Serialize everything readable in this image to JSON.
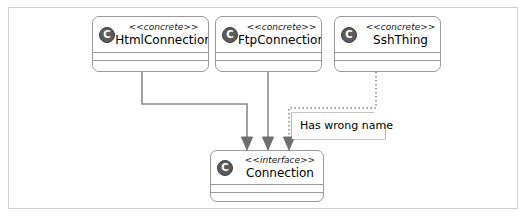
{
  "diagram": {
    "frame_border_color": "#d0d0d0",
    "box_border_color": "#9a9a9a",
    "edge_color": "#8a8a8a",
    "icon_color": "#5b5b5b",
    "classes": [
      {
        "id": "html-connection",
        "stereotype": "<<concrete>>",
        "name": "HtmlConnection",
        "icon": "C"
      },
      {
        "id": "ftp-connection",
        "stereotype": "<<concrete>>",
        "name": "FtpConnection",
        "icon": "C"
      },
      {
        "id": "ssh-thing",
        "stereotype": "<<concrete>>",
        "name": "SshThing",
        "icon": "C"
      },
      {
        "id": "connection",
        "stereotype": "<<interface>>",
        "name": "Connection",
        "icon": "C"
      }
    ],
    "note": {
      "id": "wrong-name-note",
      "text": "Has wrong name"
    },
    "edges": [
      {
        "id": "html-to-connection",
        "from": "HtmlConnection",
        "to": "Connection",
        "style": "solid",
        "arrow": "filled-triangle"
      },
      {
        "id": "ftp-to-connection",
        "from": "FtpConnection",
        "to": "Connection",
        "style": "solid",
        "arrow": "filled-triangle"
      },
      {
        "id": "ssh-to-connection",
        "from": "SshThing",
        "to": "Connection",
        "style": "dotted",
        "arrow": "filled-triangle"
      }
    ]
  }
}
